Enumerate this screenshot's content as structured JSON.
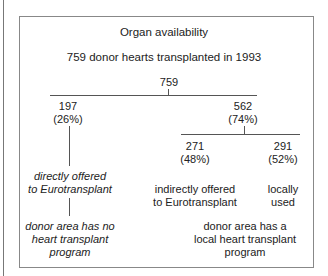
{
  "title": "Organ availability",
  "subtitle": "759 donor hearts transplanted in 1993",
  "root": {
    "value": "759"
  },
  "left": {
    "value": "197",
    "pct": "(26%)",
    "label1": "directly offered",
    "label2": "to Eurotransplant",
    "cond1": "donor area has no",
    "cond2": "heart transplant",
    "cond3": "program"
  },
  "right": {
    "value": "562",
    "pct": "(74%)",
    "cond1": "donor area has a",
    "cond2": "local heart transplant",
    "cond3": "program"
  },
  "right_a": {
    "value": "271",
    "pct": "(48%)",
    "label1": "indirectly offered",
    "label2": "to Eurotransplant"
  },
  "right_b": {
    "value": "291",
    "pct": "(52%)",
    "label1": "locally",
    "label2": "used"
  }
}
